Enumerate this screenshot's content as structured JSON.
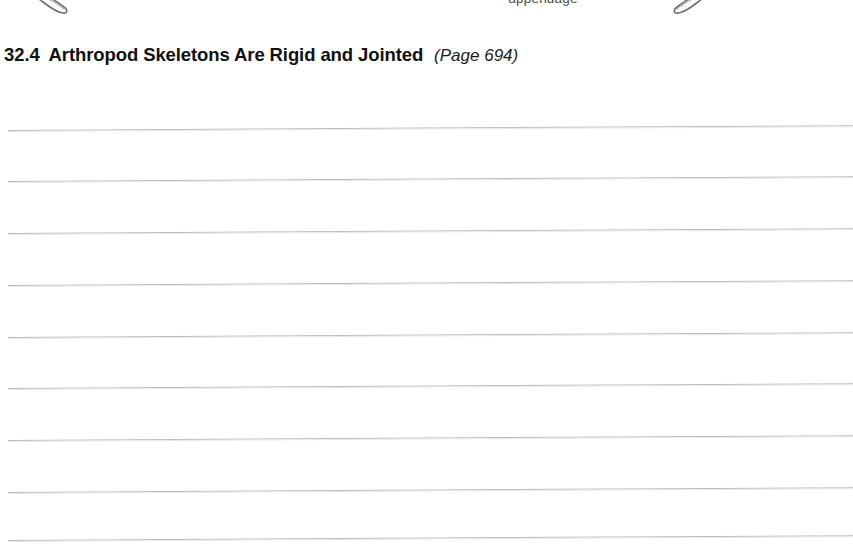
{
  "page": {
    "background_color": "#ffffff",
    "width": 853,
    "height": 545
  },
  "figure": {
    "appendage_label": "appendage",
    "label_color": "#4a4a4a",
    "shapes": [
      {
        "name": "arthropod-appendage-left",
        "orientation": "down-right"
      },
      {
        "name": "arthropod-appendage-right",
        "orientation": "down-left"
      }
    ]
  },
  "heading": {
    "number": "32.4",
    "title": "Arthropod Skeletons Are Rigid and Jointed",
    "page_ref": "(Page 694)",
    "color": "#111111"
  },
  "answer_lines": {
    "count": 9,
    "color": "#b9bcc0",
    "positions": [
      130,
      181,
      233,
      285,
      337,
      388,
      440,
      492,
      540
    ]
  }
}
